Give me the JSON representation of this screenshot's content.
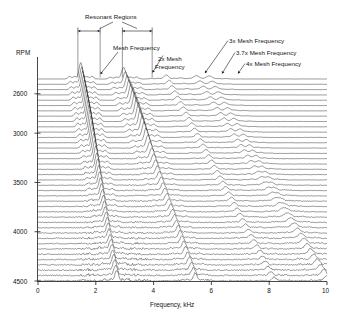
{
  "figure": {
    "kind": "waterfall-spectral-map",
    "background": "#ffffff",
    "line_color": "#1a1a1a"
  },
  "annotations": {
    "resonant_regions": "Resonant Regions",
    "mesh_frequency": "Mesh Frequency",
    "two_x_mesh_line1": "2x Mesh",
    "two_x_mesh_line2": "Frequency",
    "three_x_mesh": "3x Mesh Frequency",
    "three_seven_x_mesh": "3.7x Mesh Frequency",
    "four_x_mesh": "4x Mesh Frequency"
  },
  "yaxis": {
    "title": "RPM",
    "ticks": [
      2600,
      3000,
      3500,
      4000,
      4500
    ],
    "tick_labels": [
      "2600",
      "3000",
      "3500",
      "4000",
      "4500"
    ],
    "min": 2450,
    "max": 4500
  },
  "xaxis": {
    "title": "Frequency, kHz",
    "ticks": [
      0,
      2,
      4,
      6,
      8,
      10
    ],
    "tick_labels": [
      "0",
      "2",
      "4",
      "6",
      "8",
      "10"
    ],
    "min": 0,
    "max": 10
  },
  "chart_data": {
    "type": "line",
    "title": "",
    "xlabel": "Frequency, kHz",
    "ylabel": "RPM",
    "xlim": [
      0,
      10
    ],
    "ylim": [
      4500,
      2450
    ],
    "grid": false,
    "legend_position": "none",
    "n_traces": 39,
    "rpm_per_trace_start": 2450,
    "rpm_per_trace_end": 4500,
    "resonant_regions_khz": [
      [
        1.38,
        2.15
      ],
      [
        2.92,
        3.95
      ]
    ],
    "orders": [
      {
        "name": "Mesh Frequency",
        "multiple": 1.0,
        "khz_at_2450rpm": 1.48,
        "khz_at_4500rpm": 2.72,
        "amplitude": 1.0
      },
      {
        "name": "2x Mesh Frequency",
        "multiple": 2.0,
        "khz_at_2450rpm": 2.96,
        "khz_at_4500rpm": 5.44,
        "amplitude": 0.82
      },
      {
        "name": "3x Mesh Frequency",
        "multiple": 3.0,
        "khz_at_2450rpm": 4.44,
        "khz_at_4500rpm": 8.16,
        "amplitude": 0.42
      },
      {
        "name": "3.7x Mesh Frequency",
        "multiple": 3.7,
        "khz_at_2450rpm": 5.48,
        "khz_at_4500rpm": 10.0,
        "amplitude": 0.33
      },
      {
        "name": "4x Mesh Frequency",
        "multiple": 4.0,
        "khz_at_2450rpm": 5.92,
        "khz_at_4500rpm": 10.0,
        "amplitude": 0.3
      }
    ]
  },
  "geometry": {
    "plot_left": 38,
    "plot_right": 327,
    "trace_top": 79,
    "trace_bottom": 281,
    "axis_x": 37.5
  }
}
